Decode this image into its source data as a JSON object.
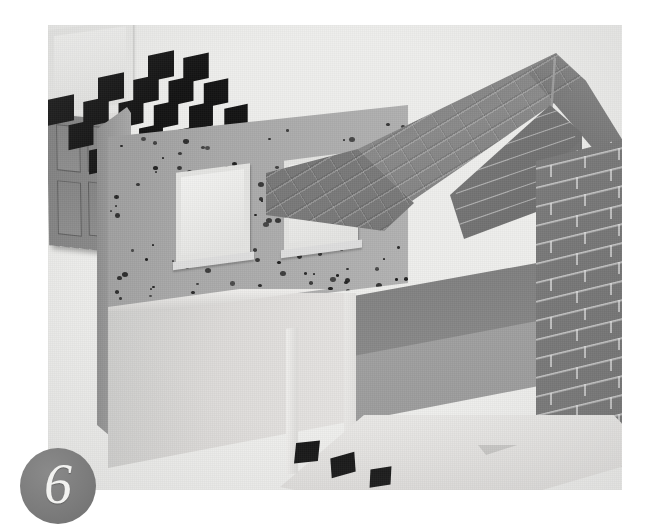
{
  "page": {
    "number": "6",
    "background_color": "#ffffff"
  },
  "photo": {
    "caption": "",
    "subject": "architectural cutaway model of a two-storey house",
    "palette": {
      "paper": "#eeeeec",
      "pebbledash_wall": "#a9a9a9",
      "render_wall": "#ddddb",
      "roof_tile": "#7e7e7e",
      "brick": "#757575",
      "tile_black": "#141414",
      "tile_white": "#e8e7e5",
      "badge_grey": "#7c7c7c"
    },
    "elements": {
      "roof_label": "pitched tiled roof",
      "gable_label": "brick gable end",
      "upper_wall_label": "pebbledash rendered upper wall",
      "lower_wall_label": "smooth rendered lower wall",
      "door_label": "four-panel front door",
      "floor_label": "chequered tiled floor",
      "loose_tiles_label": "loose floor tiles"
    }
  }
}
